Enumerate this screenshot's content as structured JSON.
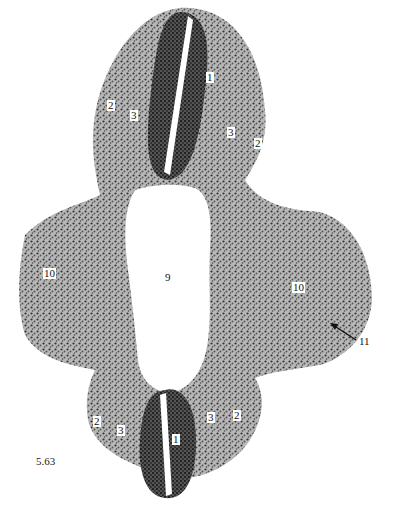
{
  "figure": {
    "number": "5.63",
    "colors": {
      "tissue_dark": "#2a2a2a",
      "tissue_mid": "#6a6a6a",
      "tissue_light": "#a8a8a8",
      "background": "#ffffff"
    }
  },
  "labels": {
    "top_neural_tube": "1",
    "top_left_2": "2",
    "top_left_3": "3",
    "top_right_3": "3",
    "top_right_2": "2",
    "cavity": "9",
    "left_10": "10",
    "right_10": "10",
    "arrow_11": "11",
    "bottom_neural_tube": "1",
    "bottom_left_2": "2",
    "bottom_left_3": "3",
    "bottom_right_3": "3",
    "bottom_right_2": "2"
  }
}
